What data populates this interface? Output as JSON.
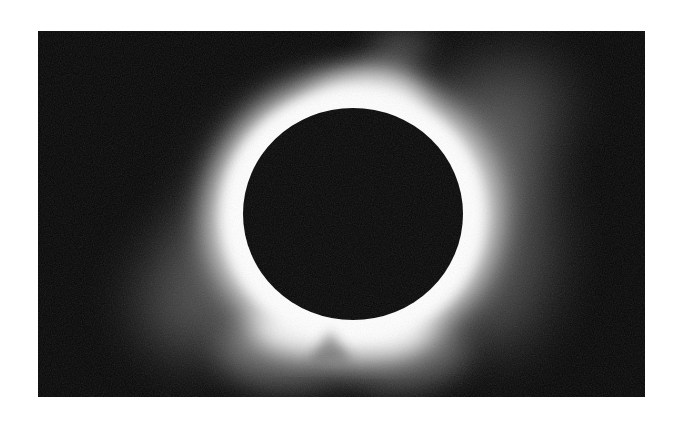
{
  "image": {
    "subject": "Total solar eclipse",
    "description": "Black lunar disc surrounded by a bright white solar corona with faint streamers against a black sky",
    "colors": {
      "page_background": "#ffffff",
      "sky": "#050505",
      "moon_disc": "#060606",
      "corona_core": "#ffffff"
    },
    "frame": {
      "x": 38,
      "y": 31,
      "width": 607,
      "height": 366
    },
    "moon": {
      "cx": 353,
      "cy": 214,
      "rx": 110,
      "ry": 106
    }
  }
}
